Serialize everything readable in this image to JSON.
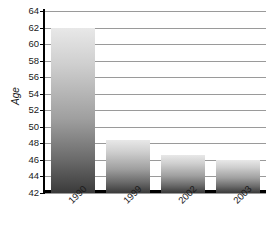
{
  "chart_data": {
    "type": "bar",
    "title": "",
    "subtitle": "",
    "xlabel": "",
    "ylabel": "Age",
    "categories": [
      "1990",
      "1999",
      "2002",
      "2003"
    ],
    "values": [
      62.0,
      48.4,
      46.6,
      46.0
    ],
    "series": [
      {
        "name": "Age",
        "values": [
          62.0,
          48.4,
          46.6,
          46.0
        ]
      }
    ],
    "ylim": [
      42,
      64
    ],
    "yticks": [
      42,
      44,
      46,
      48,
      50,
      52,
      54,
      56,
      58,
      60,
      62,
      64
    ],
    "ytick_labels": [
      "42",
      "44",
      "46",
      "48",
      "50",
      "52",
      "54",
      "56",
      "58",
      "60",
      "62",
      "64"
    ],
    "grid": true,
    "grid_axis": "y",
    "legend": false,
    "legend_position": "none",
    "xtick_rotation": -45,
    "bar_fill": "vertical-gray-gradient",
    "colors": {
      "bar_top": "#e8e8e8",
      "bar_bottom": "#3a3a3a",
      "gridline": "#9a9a9a",
      "axis": "#000000",
      "text": "#1a1a1a",
      "background": "#ffffff"
    }
  }
}
